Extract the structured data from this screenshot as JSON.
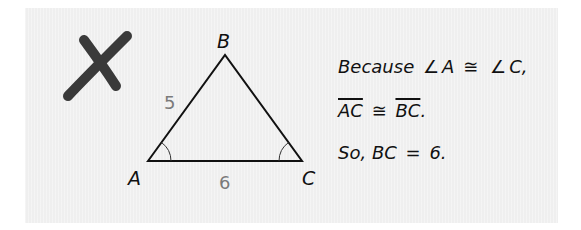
{
  "figure": {
    "mark": {
      "name": "incorrect-x-mark",
      "color": "#3a3a3a"
    },
    "triangle": {
      "vertices": {
        "A": {
          "label": "A",
          "x": 148,
          "y": 161
        },
        "B": {
          "label": "B",
          "x": 225,
          "y": 55
        },
        "C": {
          "label": "C",
          "x": 302,
          "y": 161
        }
      },
      "side_labels": {
        "AB": "5",
        "AC": "6"
      },
      "angle_marks": [
        "A",
        "C"
      ],
      "stroke_color": "#111111",
      "side_label_color": "#7a7a7a"
    }
  },
  "reasoning": {
    "line1": {
      "prefix": "Because",
      "angle_symbol": "∠",
      "angle1": "A",
      "congruent": "≅",
      "angle2": "C",
      "suffix": ","
    },
    "line2": {
      "segment1": "AC",
      "congruent": "≅",
      "segment2": "BC",
      "suffix": "."
    },
    "line3": {
      "prefix": "So,",
      "segment": "BC",
      "equals": "=",
      "value": "6",
      "suffix": "."
    }
  },
  "colors": {
    "panel_background": "#efefef",
    "text": "#111111"
  }
}
